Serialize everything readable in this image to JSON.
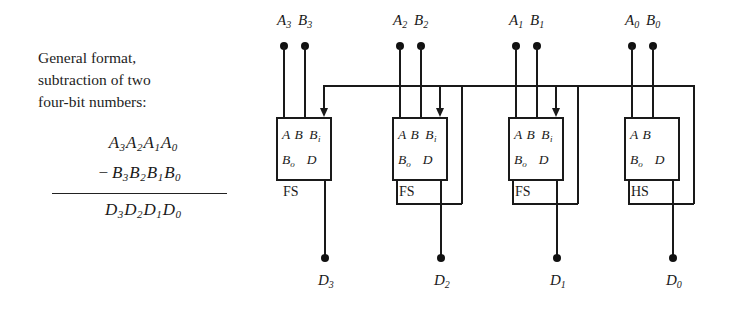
{
  "caption": {
    "lines": [
      "General format,",
      "subtraction of two",
      "four-bit numbers:"
    ]
  },
  "math": {
    "minuend": "A3A2A1A0",
    "minuend_terms": [
      "A",
      "3",
      "A",
      "2",
      "A",
      "1",
      "A",
      "0"
    ],
    "operator": "−",
    "subtrahend": "B3B2B1B0",
    "result": "D3D2D1D0"
  },
  "circuit": {
    "type": "four-bit ripple-borrow subtractor",
    "top_inputs": [
      {
        "a": "A",
        "a_sub": "3",
        "b": "B",
        "b_sub": "3"
      },
      {
        "a": "A",
        "a_sub": "2",
        "b": "B",
        "b_sub": "2"
      },
      {
        "a": "A",
        "a_sub": "1",
        "b": "B",
        "b_sub": "1"
      },
      {
        "a": "A",
        "a_sub": "0",
        "b": "B",
        "b_sub": "0"
      }
    ],
    "blocks": [
      {
        "name": "FS",
        "port_a": "A",
        "port_b": "B",
        "port_bi": "B",
        "port_bi_sub": "i",
        "port_bo": "B",
        "port_bo_sub": "o",
        "port_d": "D",
        "has_borrow_in": true
      },
      {
        "name": "FS",
        "port_a": "A",
        "port_b": "B",
        "port_bi": "B",
        "port_bi_sub": "i",
        "port_bo": "B",
        "port_bo_sub": "o",
        "port_d": "D",
        "has_borrow_in": true
      },
      {
        "name": "FS",
        "port_a": "A",
        "port_b": "B",
        "port_bi": "B",
        "port_bi_sub": "i",
        "port_bo": "B",
        "port_bo_sub": "o",
        "port_d": "D",
        "has_borrow_in": true
      },
      {
        "name": "HS",
        "port_a": "A",
        "port_b": "B",
        "port_bi": "",
        "port_bi_sub": "",
        "port_bo": "B",
        "port_bo_sub": "o",
        "port_d": "D",
        "has_borrow_in": false
      }
    ],
    "outputs": [
      {
        "d": "D",
        "sub": "3"
      },
      {
        "d": "D",
        "sub": "2"
      },
      {
        "d": "D",
        "sub": "1"
      },
      {
        "d": "D",
        "sub": "0"
      }
    ]
  },
  "colors": {
    "background": "#ffffff",
    "ink": "#1a1a1a",
    "wire": "#191919"
  }
}
